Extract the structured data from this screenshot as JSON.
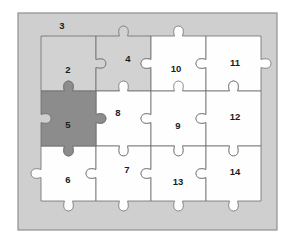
{
  "figure": {
    "name": "jigsaw-puzzle-diagram",
    "title": "",
    "width": 295,
    "height": 242
  },
  "colors": {
    "page_background": "#ffffff",
    "tray_fill": "#cfcfcf",
    "tray_border": "#8f8f8f",
    "piece_white": "#fefefe",
    "piece_light_gray": "#d2d2d2",
    "piece_dark_gray": "#8c8c8c",
    "piece_outline": "#6d6d6d",
    "label_text": "#1c1c1c"
  },
  "tray": {
    "label": "puzzle-tray",
    "x": 18,
    "y": 13,
    "width": 259,
    "height": 217
  },
  "grid": {
    "label": "puzzle-grid",
    "x": 41,
    "y": 36,
    "cols": 4,
    "rows": 3,
    "cell_width": 55,
    "cell_height": 55,
    "col_edges": [
      41,
      96,
      151,
      206,
      261
    ],
    "row_edges": [
      36,
      91,
      146,
      201
    ]
  },
  "background_labels": [
    {
      "id": "bg-label-3",
      "text": "3",
      "x": 62,
      "y": 26
    }
  ],
  "pieces": [
    {
      "id": "piece-2",
      "label": "2",
      "row": 0,
      "col": 0,
      "shade": "light",
      "fill": "#d2d2d2",
      "label_x": 68,
      "label_y": 70,
      "edges": {
        "top": "flat",
        "right": "tab",
        "bottom": "blank",
        "left": "flat"
      }
    },
    {
      "id": "piece-4",
      "label": "4",
      "row": 0,
      "col": 1,
      "shade": "light",
      "fill": "#d2d2d2",
      "label_x": 128,
      "label_y": 59,
      "edges": {
        "top": "tab",
        "right": "blank",
        "bottom": "tab",
        "left": "blank"
      }
    },
    {
      "id": "piece-10",
      "label": "10",
      "row": 0,
      "col": 2,
      "shade": "white",
      "fill": "#fefefe",
      "label_x": 176,
      "label_y": 69,
      "edges": {
        "top": "tab",
        "right": "blank",
        "bottom": "tab",
        "left": "tab"
      }
    },
    {
      "id": "piece-11",
      "label": "11",
      "row": 0,
      "col": 3,
      "shade": "white",
      "fill": "#fefefe",
      "label_x": 235,
      "label_y": 63,
      "edges": {
        "top": "flat",
        "right": "tab",
        "bottom": "blank",
        "left": "tab"
      }
    },
    {
      "id": "piece-5",
      "label": "5",
      "row": 1,
      "col": 0,
      "shade": "dark",
      "fill": "#8c8c8c",
      "label_x": 68,
      "label_y": 125,
      "edges": {
        "top": "tab",
        "right": "tab",
        "bottom": "tab",
        "left": "blank"
      }
    },
    {
      "id": "piece-8",
      "label": "8",
      "row": 1,
      "col": 1,
      "shade": "white",
      "fill": "#fefefe",
      "label_x": 118,
      "label_y": 113,
      "edges": {
        "top": "tab",
        "right": "blank",
        "bottom": "tab",
        "left": "blank"
      }
    },
    {
      "id": "piece-9",
      "label": "9",
      "row": 1,
      "col": 2,
      "shade": "white",
      "fill": "#fefefe",
      "label_x": 178,
      "label_y": 126,
      "edges": {
        "top": "tab",
        "right": "blank",
        "bottom": "tab",
        "left": "tab"
      }
    },
    {
      "id": "piece-12",
      "label": "12",
      "row": 1,
      "col": 3,
      "shade": "white",
      "fill": "#fefefe",
      "label_x": 235,
      "label_y": 117,
      "edges": {
        "top": "tab",
        "right": "flat",
        "bottom": "tab",
        "left": "tab"
      }
    },
    {
      "id": "piece-6",
      "label": "6",
      "row": 2,
      "col": 0,
      "shade": "white",
      "fill": "#fefefe",
      "label_x": 68,
      "label_y": 180,
      "edges": {
        "top": "blank",
        "right": "blank",
        "bottom": "tab",
        "left": "tab"
      }
    },
    {
      "id": "piece-7",
      "label": "7",
      "row": 2,
      "col": 1,
      "shade": "white",
      "fill": "#fefefe",
      "label_x": 127,
      "label_y": 170,
      "edges": {
        "top": "blank",
        "right": "blank",
        "bottom": "tab",
        "left": "tab"
      }
    },
    {
      "id": "piece-13",
      "label": "13",
      "row": 2,
      "col": 2,
      "shade": "white",
      "fill": "#fefefe",
      "label_x": 178,
      "label_y": 182,
      "edges": {
        "top": "blank",
        "right": "blank",
        "bottom": "tab",
        "left": "tab"
      }
    },
    {
      "id": "piece-14",
      "label": "14",
      "row": 2,
      "col": 3,
      "shade": "white",
      "fill": "#fefefe",
      "label_x": 235,
      "label_y": 172,
      "edges": {
        "top": "blank",
        "right": "flat",
        "bottom": "tab",
        "left": "tab"
      }
    }
  ]
}
